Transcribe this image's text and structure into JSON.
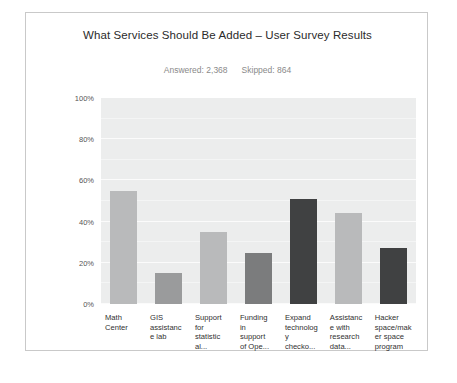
{
  "card": {
    "title": "What Services Should Be Added – User Survey Results",
    "answered_label": "Answered: 2,368",
    "skipped_label": "Skipped: 864"
  },
  "chart_data": {
    "type": "bar",
    "title": "What Services Should Be Added – User Survey Results",
    "subtitle": "Answered: 2,368    Skipped: 864",
    "xlabel": "",
    "ylabel": "",
    "ylim": [
      0,
      100
    ],
    "grid": true,
    "legend": "none",
    "yticks": [
      "0%",
      "20%",
      "40%",
      "60%",
      "80%",
      "100%"
    ],
    "ytick_values": [
      0,
      20,
      40,
      60,
      80,
      100
    ],
    "categories": [
      "Math Center",
      "GIS assistance lab",
      "Support for statistical...",
      "Funding in support of Ope...",
      "Expand technology checko...",
      "Assistance with research data...",
      "Hacker space/maker space program"
    ],
    "category_lines": [
      [
        "Math",
        "Center"
      ],
      [
        "GIS",
        "assistanc",
        "e lab"
      ],
      [
        "Support",
        "for",
        "statistic",
        "al..."
      ],
      [
        "Funding",
        "in",
        "support",
        "of Ope..."
      ],
      [
        "Expand",
        "technolog",
        "y",
        "checko..."
      ],
      [
        "Assistanc",
        "e with",
        "research",
        "data..."
      ],
      [
        "Hacker",
        "space/mak",
        "er space",
        "program"
      ]
    ],
    "values": [
      55,
      15,
      35,
      25,
      51,
      44,
      27
    ],
    "bar_colors": [
      "#b9babb",
      "#9a9b9c",
      "#b9babb",
      "#7b7c7d",
      "#404142",
      "#b9babb",
      "#404142"
    ],
    "plot_background": "#eceded",
    "gridline_color": "#fbfbfb"
  }
}
